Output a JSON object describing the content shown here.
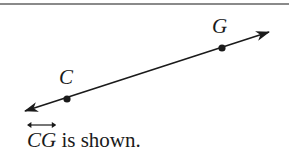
{
  "diagram": {
    "type": "line",
    "points": [
      {
        "name": "C",
        "x": 67,
        "y": 99,
        "label_x": 59,
        "label_y": 84
      },
      {
        "name": "G",
        "x": 222,
        "y": 48,
        "label_x": 212,
        "label_y": 33
      }
    ],
    "line": {
      "from": {
        "x": 25,
        "y": 111
      },
      "to": {
        "x": 269,
        "y": 32
      },
      "color": "#1a1a1a",
      "arrowheads": "both"
    }
  },
  "caption": {
    "line_name": "CG",
    "text": " is shown."
  }
}
